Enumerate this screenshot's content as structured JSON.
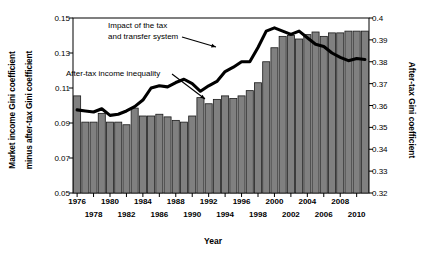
{
  "chart_data": {
    "type": "bar",
    "title": "",
    "xlabel": "Year",
    "ylabel_left": "Market income Gini coefficient",
    "ylabel_left_line2": "minus after-tax Gini coefficient",
    "ylabel_right": "After-tax Gini coefficient",
    "ylim_left": [
      0.05,
      0.15
    ],
    "ylim_right": [
      0.32,
      0.4
    ],
    "yticks_left": [
      "0.05",
      "0.07",
      "0.09",
      "0.11",
      "0.13",
      "0.15"
    ],
    "yticks_left_values": [
      0.05,
      0.07,
      0.09,
      0.11,
      0.13,
      0.15
    ],
    "yticks_right": [
      "0.32",
      "0.33",
      "0.34",
      "0.35",
      "0.36",
      "0.37",
      "0.38",
      "0.39",
      "0.4"
    ],
    "yticks_right_values": [
      0.32,
      0.33,
      0.34,
      0.35,
      0.36,
      0.37,
      0.38,
      0.39,
      0.4
    ],
    "grid": false,
    "legend": "none",
    "xtick_labels": [
      "1976",
      "1978",
      "1980",
      "1982",
      "1984",
      "1986",
      "1988",
      "1990",
      "1992",
      "1994",
      "1996",
      "1998",
      "2000",
      "2002",
      "2004",
      "2006",
      "2008",
      "2010"
    ],
    "xtick_years": [
      1976,
      1978,
      1980,
      1982,
      1984,
      1986,
      1988,
      1990,
      1992,
      1994,
      1996,
      1998,
      2000,
      2002,
      2004,
      2006,
      2008,
      2010
    ],
    "categories": [
      1976,
      1977,
      1978,
      1979,
      1980,
      1981,
      1982,
      1983,
      1984,
      1985,
      1986,
      1987,
      1988,
      1989,
      1990,
      1991,
      1992,
      1993,
      1994,
      1995,
      1996,
      1997,
      1998,
      1999,
      2000,
      2001,
      2002,
      2003,
      2004,
      2005,
      2006,
      2007,
      2008,
      2009,
      2010,
      2011
    ],
    "series": [
      {
        "name": "Impact of the tax and transfer system",
        "chart_type": "bar",
        "axis": "left",
        "color": "#808080",
        "values": [
          0.1055,
          0.0905,
          0.0905,
          0.0955,
          0.0905,
          0.0905,
          0.089,
          0.0985,
          0.094,
          0.094,
          0.095,
          0.0935,
          0.0915,
          0.0905,
          0.094,
          0.1045,
          0.101,
          0.1035,
          0.1055,
          0.104,
          0.1055,
          0.1085,
          0.113,
          0.125,
          0.133,
          0.1395,
          0.14,
          0.138,
          0.1405,
          0.142,
          0.1395,
          0.1415,
          0.1415,
          0.1425,
          0.1425,
          0.1425
        ]
      },
      {
        "name": "After-tax income inequality",
        "chart_type": "line",
        "axis": "right",
        "color": "#000000",
        "values": [
          0.358,
          0.3575,
          0.357,
          0.3585,
          0.3555,
          0.356,
          0.3575,
          0.3595,
          0.3625,
          0.368,
          0.369,
          0.3685,
          0.3705,
          0.372,
          0.37,
          0.3665,
          0.369,
          0.371,
          0.3755,
          0.3775,
          0.38,
          0.38,
          0.3865,
          0.394,
          0.3955,
          0.394,
          0.3925,
          0.394,
          0.391,
          0.388,
          0.387,
          0.384,
          0.382,
          0.3805,
          0.3815,
          0.381
        ]
      }
    ],
    "annotations": [
      {
        "name": "impact-annotation",
        "line1": "Impact of the tax",
        "line2": "and transfer system",
        "points_to": "bar-series"
      },
      {
        "name": "after-tax-annotation",
        "line1": "After-tax income inequality",
        "line2": "",
        "points_to": "line-series"
      }
    ]
  }
}
